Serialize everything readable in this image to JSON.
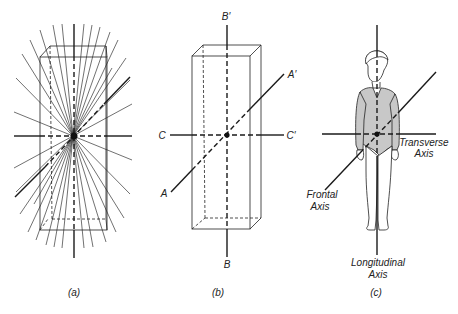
{
  "figure": {
    "panels": [
      {
        "id": "a",
        "caption": "(a)",
        "description": "Rectangular prism with many axes of rotation radiating through its center"
      },
      {
        "id": "b",
        "caption": "(b)",
        "axis_labels": {
          "A": "A",
          "A_prime": "A′",
          "B": "B",
          "B_prime": "B′",
          "C": "C",
          "C_prime": "C′"
        },
        "description": "Rectangular prism with three principal axes AA′, BB′, CC′"
      },
      {
        "id": "c",
        "caption": "(c)",
        "axis_labels": {
          "transverse_line1": "Transverse",
          "transverse_line2": "Axis",
          "frontal_line1": "Frontal",
          "frontal_line2": "Axis",
          "longitudinal_line1": "Longitudinal",
          "longitudinal_line2": "Axis"
        },
        "description": "Human figure with transverse, frontal and longitudinal axes"
      }
    ]
  },
  "colors": {
    "line": "#1a1a1a",
    "thin_line": "#333333",
    "shading": "#c8c8c8",
    "background": "#ffffff"
  }
}
